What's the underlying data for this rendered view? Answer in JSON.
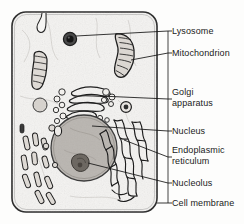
{
  "figure": {
    "style": {
      "ink": "#1b1b1b",
      "cytoplasm": "#f4f3f1",
      "membrane_stroke": "#2a2a2a",
      "nucleus_fill": "#b9b5b0",
      "nucleolus_fill": "#6d6862",
      "lysosome_fill": "#2b2b2b",
      "leader_rail_x": 168
    },
    "cell": {
      "name": "cell-body",
      "x": 12,
      "y": 12,
      "width": 145,
      "height": 200,
      "corner_radius": 14
    },
    "structures": [
      {
        "id": "lysosome",
        "label": "Lysosome"
      },
      {
        "id": "mitochondrion",
        "label": "Mitochondrion"
      },
      {
        "id": "golgi",
        "label": "Golgi apparatus"
      },
      {
        "id": "nucleus",
        "label": "Nucleus"
      },
      {
        "id": "er",
        "label": "Endoplasmic reticulum"
      },
      {
        "id": "nucleolus",
        "label": "Nucleolus"
      },
      {
        "id": "cell_membrane",
        "label": "Cell membrane"
      }
    ]
  },
  "labels": {
    "lysosome": {
      "line1": "Lysosome",
      "line2": "",
      "x": 172,
      "y": 26,
      "tick_y": 31,
      "leader_to_x": 70,
      "leader_to_y": 39
    },
    "mitochondrion": {
      "line1": "Mitochondrion",
      "line2": "",
      "x": 172,
      "y": 48,
      "tick_y": 53,
      "leader_to_x": 128,
      "leader_to_y": 57
    },
    "golgi": {
      "line1": "Golgi",
      "line2": "apparatus",
      "x": 172,
      "y": 87,
      "tick_y": 99,
      "leader_to_x": 96,
      "leader_to_y": 95
    },
    "nucleus": {
      "line1": "Nucleus",
      "line2": "",
      "x": 172,
      "y": 126,
      "tick_y": 131,
      "leader_to_x": 92,
      "leader_to_y": 126
    },
    "er": {
      "line1": "Endoplasmic",
      "line2": "reticulum",
      "x": 172,
      "y": 145,
      "tick_y": 157,
      "leader_to_x": 122,
      "leader_to_y": 139
    },
    "nucleolus": {
      "line1": "Nucleolus",
      "line2": "",
      "x": 172,
      "y": 178,
      "tick_y": 183,
      "leader_to_x": 88,
      "leader_to_y": 162
    },
    "cell_membrane": {
      "line1": "Cell membrane",
      "line2": "",
      "x": 172,
      "y": 198,
      "tick_y": 203,
      "leader_to_x": 157,
      "leader_to_y": 203
    }
  }
}
